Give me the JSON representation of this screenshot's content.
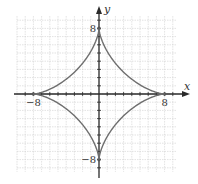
{
  "chart_data": {
    "type": "line",
    "title": "",
    "equation": "x^(2/3) + y^(2/3) = 8^(2/3)",
    "curve": "astroid",
    "parameter_a": 8,
    "xlabel": "x",
    "ylabel": "y",
    "xlim": [
      -10,
      10
    ],
    "ylim": [
      -10,
      10
    ],
    "grid": true,
    "grid_step": 1,
    "tick_labels": {
      "x": [
        {
          "value": -8,
          "label": "−8"
        },
        {
          "value": 8,
          "label": "8"
        }
      ],
      "y": [
        {
          "value": 8,
          "label": "8"
        },
        {
          "value": -8,
          "label": "−8"
        }
      ]
    },
    "key_points": [
      {
        "x": 8,
        "y": 0
      },
      {
        "x": 0,
        "y": 8
      },
      {
        "x": -8,
        "y": 0
      },
      {
        "x": 0,
        "y": -8
      }
    ],
    "series": [
      {
        "name": "astroid",
        "color": "#6e6e6e"
      }
    ],
    "colors": {
      "grid": "#cfcfcf",
      "axes": "#2a2a2a",
      "curve": "#6e6e6e"
    }
  }
}
